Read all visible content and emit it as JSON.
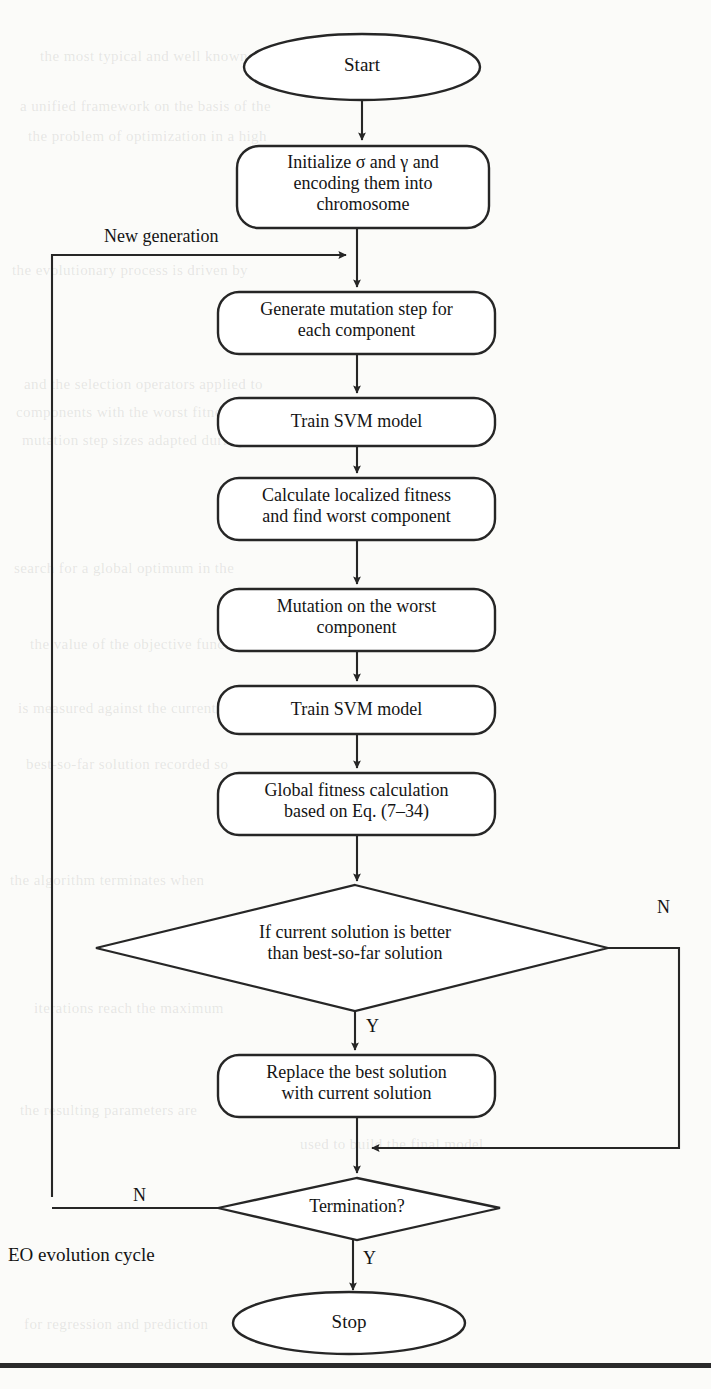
{
  "figure": {
    "type": "flowchart",
    "caption_label": "EO evolution cycle"
  },
  "nodes": {
    "start": {
      "id": "start",
      "shape": "ellipse",
      "label": "Start"
    },
    "initialize": {
      "id": "initialize",
      "shape": "rounded-rect",
      "label": "Initialize σ and γ and\nencoding them into\nchromosome"
    },
    "generate_mutation": {
      "id": "generate_mutation",
      "shape": "rounded-rect",
      "label": "Generate mutation step for\neach component"
    },
    "train_svm_1": {
      "id": "train_svm_1",
      "shape": "rounded-rect",
      "label": "Train SVM model"
    },
    "calculate_local": {
      "id": "calculate_local",
      "shape": "rounded-rect",
      "label": "Calculate localized fitness\nand find worst component"
    },
    "mutation_worst": {
      "id": "mutation_worst",
      "shape": "rounded-rect",
      "label": "Mutation on the worst\ncomponent"
    },
    "train_svm_2": {
      "id": "train_svm_2",
      "shape": "rounded-rect",
      "label": "Train SVM model"
    },
    "global_fitness": {
      "id": "global_fitness",
      "shape": "rounded-rect",
      "label": "Global fitness calculation\nbased on Eq. (7–34)"
    },
    "decision_better": {
      "id": "decision_better",
      "shape": "diamond",
      "label": "If current solution is better\nthan best-so-far solution"
    },
    "replace_best": {
      "id": "replace_best",
      "shape": "rounded-rect",
      "label": "Replace the best solution\nwith current solution"
    },
    "decision_termination": {
      "id": "decision_termination",
      "shape": "diamond",
      "label": "Termination?"
    },
    "stop": {
      "id": "stop",
      "shape": "ellipse",
      "label": "Stop"
    }
  },
  "edge_labels": {
    "new_generation": "New generation",
    "better_no": "N",
    "better_yes": "Y",
    "termination_no": "N",
    "termination_yes": "Y"
  },
  "colors": {
    "stroke": "#262626",
    "text": "#141414",
    "background": "#fbfbf9",
    "rule": "#2a2a2a"
  },
  "bleed_text": [
    "the most typical and well known among them",
    "a unified framework on the basis of the",
    "the problem of optimization in a high",
    "the evolutionary process is driven by",
    "and the selection operators applied to",
    "components with the worst fitness are",
    "mutation step sizes adapted during",
    "search for a global optimum in the",
    "the value of the objective function",
    "is measured against the current",
    "best-so-far solution recorded so",
    "the algorithm terminates when",
    "iterations reach the maximum",
    "the resulting parameters are",
    "used to build the final model",
    "for regression and prediction"
  ]
}
